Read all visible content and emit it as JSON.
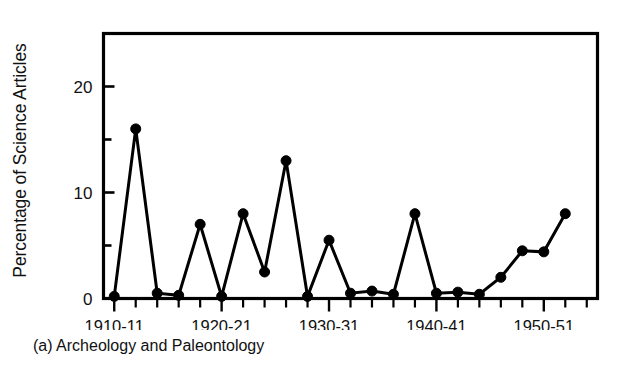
{
  "caption": "(a) Archeology and Paleontology",
  "axis": {
    "y_title": "Percentage of Science Articles",
    "y_tick_labels": [
      "0",
      "10",
      "20"
    ],
    "x_tick_labels": [
      "1910-11",
      "1920-21",
      "1930-31",
      "1940-41",
      "1950-51"
    ]
  },
  "colors": {
    "line": "#000000",
    "marker": "#000000",
    "frame": "#000000",
    "background": "#ffffff"
  },
  "chart_data": {
    "type": "line",
    "title": "",
    "subtitle": "",
    "xlabel": "",
    "ylabel": "Percentage of Science Articles",
    "xlim": [
      1909,
      1955
    ],
    "ylim": [
      0,
      25
    ],
    "y_ticks": [
      0,
      5,
      10,
      15,
      20,
      25
    ],
    "y_major_ticks": [
      0,
      10,
      20
    ],
    "y_tick_labels": [
      "0",
      "10",
      "20"
    ],
    "grid": false,
    "legend": "none",
    "categories": [
      "1910-11",
      "1912-13",
      "1914-15",
      "1916-17",
      "1918-19",
      "1920-21",
      "1922-23",
      "1924-25",
      "1926-27",
      "1928-29",
      "1930-31",
      "1932-33",
      "1934-35",
      "1936-37",
      "1938-39",
      "1940-41",
      "1942-43",
      "1944-45",
      "1946-47",
      "1948-49",
      "1950-51",
      "1952-53"
    ],
    "x": [
      1910,
      1912,
      1914,
      1916,
      1918,
      1920,
      1922,
      1924,
      1926,
      1928,
      1930,
      1932,
      1934,
      1936,
      1938,
      1940,
      1942,
      1944,
      1946,
      1948,
      1950,
      1952
    ],
    "values": [
      0.2,
      16,
      0.5,
      0.3,
      7,
      0.2,
      8,
      2.5,
      13,
      0.2,
      5.5,
      0.5,
      0.7,
      0.4,
      8,
      0.5,
      0.6,
      0.4,
      2,
      4.5,
      4.4,
      8
    ],
    "series": [
      {
        "name": "Archeology and Paleontology",
        "values": [
          0.2,
          16,
          0.5,
          0.3,
          7,
          0.2,
          8,
          2.5,
          13,
          0.2,
          5.5,
          0.5,
          0.7,
          0.4,
          8,
          0.5,
          0.6,
          0.4,
          2,
          4.5,
          4.4,
          8
        ]
      }
    ],
    "x_labeled_ticks": [
      {
        "x": 1910,
        "label": "1910-11"
      },
      {
        "x": 1920,
        "label": "1920-21"
      },
      {
        "x": 1930,
        "label": "1930-31"
      },
      {
        "x": 1940,
        "label": "1940-41"
      },
      {
        "x": 1950,
        "label": "1950-51"
      }
    ]
  }
}
